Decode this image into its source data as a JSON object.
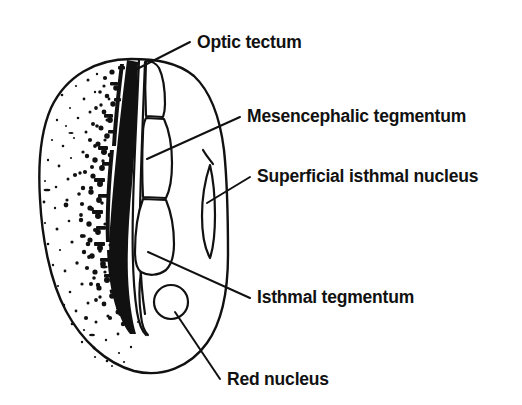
{
  "figure": {
    "kind": "anatomical-line-drawing",
    "background_color": "#ffffff",
    "ink_color": "#111111",
    "width": 522,
    "height": 405
  },
  "labels": [
    {
      "id": "optic-tectum",
      "text": "Optic tectum",
      "text_x": 197,
      "text_y": 48,
      "leader": "M 190 42 L 135 70",
      "target_structure": "optic-tectum-region"
    },
    {
      "id": "mesencephalic-tegmentum",
      "text": "Mesencephalic tegmentum",
      "text_x": 247,
      "text_y": 122,
      "leader": "M 240 117 L 147 159",
      "target_structure": "mesencephalic-tegmentum-region"
    },
    {
      "id": "superficial-isthmal-nucleus",
      "text": "Superficial isthmal nucleus",
      "text_x": 257,
      "text_y": 182,
      "leader": "M 250 177 L 207 203",
      "target_structure": "superficial-isthmal-nucleus-region"
    },
    {
      "id": "isthmal-tegmentum",
      "text": "Isthmal tegmentum",
      "text_x": 257,
      "text_y": 303,
      "leader": "M 250 298 L 148 252",
      "target_structure": "isthmal-tegmentum-region"
    },
    {
      "id": "red-nucleus",
      "text": "Red nucleus",
      "text_x": 227,
      "text_y": 385,
      "leader": "M 220 379 L 175 312",
      "target_structure": "red-nucleus-region"
    }
  ],
  "structures": [
    {
      "id": "brain-outline",
      "name": "brain section outline"
    },
    {
      "id": "optic-tectum-region",
      "name": "optic tectum"
    },
    {
      "id": "mesencephalic-tegmentum-region",
      "name": "mesencephalic tegmentum"
    },
    {
      "id": "superficial-isthmal-nucleus-region",
      "name": "superficial isthmal nucleus"
    },
    {
      "id": "isthmal-tegmentum-region",
      "name": "isthmal tegmentum"
    },
    {
      "id": "red-nucleus-region",
      "name": "red nucleus"
    },
    {
      "id": "tectal-labelling-band",
      "name": "dense tectal labelling band"
    },
    {
      "id": "stipple-field",
      "name": "stippled labelling field"
    }
  ]
}
